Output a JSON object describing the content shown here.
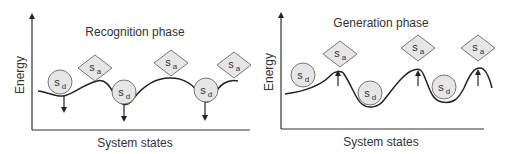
{
  "panels": [
    {
      "id": "recognition",
      "title": "Recognition phase",
      "xlabel": "System states",
      "ylabel": "Energy",
      "circle_states": [
        {
          "symbol": "s",
          "subscript": "d"
        },
        {
          "symbol": "s",
          "subscript": "d"
        },
        {
          "symbol": "s",
          "subscript": "d"
        }
      ],
      "diamond_states": [
        {
          "symbol": "s",
          "subscript": "a"
        },
        {
          "symbol": "s",
          "subscript": "a"
        },
        {
          "symbol": "s",
          "subscript": "a"
        }
      ],
      "arrow_direction": "down"
    },
    {
      "id": "generation",
      "title": "Generation phase",
      "xlabel": "System states",
      "ylabel": "Energy",
      "circle_states": [
        {
          "symbol": "s",
          "subscript": "d"
        },
        {
          "symbol": "s",
          "subscript": "d"
        },
        {
          "symbol": "s",
          "subscript": "d"
        }
      ],
      "diamond_states": [
        {
          "symbol": "s",
          "subscript": "a"
        },
        {
          "symbol": "s",
          "subscript": "a"
        },
        {
          "symbol": "s",
          "subscript": "a"
        }
      ],
      "arrow_direction": "up"
    }
  ],
  "colors": {
    "shape_fill": "#e6e6e6",
    "shape_stroke": "#777777",
    "line": "#222222"
  }
}
